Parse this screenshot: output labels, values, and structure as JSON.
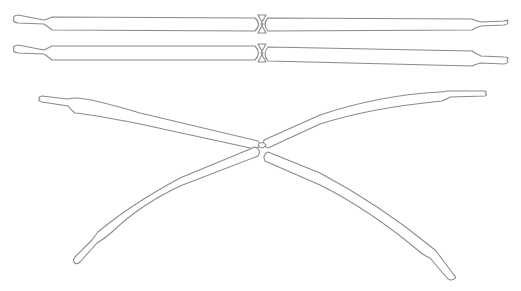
{
  "figure": {
    "stroke_color": "#8a8a8a",
    "background": "#ffffff",
    "parts": [
      {
        "name": "straight-pair-top",
        "type": "two balloons joined end to end"
      },
      {
        "name": "straight-pair-bottom",
        "type": "two balloons joined end to end"
      },
      {
        "name": "x-crossing",
        "type": "four balloon segments twisted at center"
      }
    ]
  }
}
